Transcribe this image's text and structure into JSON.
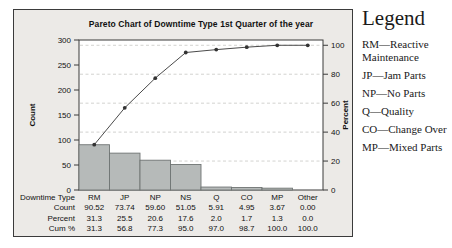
{
  "chart_data": {
    "type": "bar",
    "subtype": "pareto",
    "title": "Pareto Chart of Downtime Type 1st Quarter of the year",
    "categories": [
      "RM",
      "JP",
      "NP",
      "NS",
      "Q",
      "CO",
      "MP",
      "Other"
    ],
    "series": [
      {
        "name": "Count",
        "type": "bar",
        "axis": "left",
        "values": [
          90.52,
          73.74,
          59.6,
          51.05,
          5.91,
          4.95,
          3.67,
          0.0
        ]
      },
      {
        "name": "Cum %",
        "type": "line",
        "axis": "right",
        "values": [
          31.3,
          56.8,
          77.3,
          95.0,
          97.0,
          98.7,
          100.0,
          100.0
        ]
      }
    ],
    "left_axis": {
      "label": "Count",
      "min": 0,
      "max": 300,
      "ticks": [
        0,
        50,
        100,
        150,
        200,
        250,
        300
      ]
    },
    "right_axis": {
      "label": "Percent",
      "min": 0,
      "max": 100,
      "ticks": [
        0,
        20,
        40,
        60,
        80,
        100
      ]
    },
    "grid": {
      "horizontal_dashed_at_right_axis_ticks": true
    },
    "legend_position": "right-outside"
  },
  "table": {
    "rows": [
      {
        "label": "Downtime Type",
        "values": [
          "RM",
          "JP",
          "NP",
          "NS",
          "Q",
          "CO",
          "MP",
          "Other"
        ]
      },
      {
        "label": "Count",
        "values": [
          "90.52",
          "73.74",
          "59.60",
          "51.05",
          "5.91",
          "4.95",
          "3.67",
          "0.00"
        ]
      },
      {
        "label": "Percent",
        "values": [
          "31.3",
          "25.5",
          "20.6",
          "17.6",
          "2.0",
          "1.7",
          "1.3",
          "0.0"
        ]
      },
      {
        "label": "Cum %",
        "values": [
          "31.3",
          "56.8",
          "77.3",
          "95.0",
          "97.0",
          "98.7",
          "100.0",
          "100.0"
        ]
      }
    ]
  },
  "legend": {
    "title": "Legend",
    "items": [
      "RM—Reactive Maintenance",
      "JP—Jam Parts",
      "NP—No Parts",
      "Q—Quality",
      "CO—Change Over",
      "MP—Mixed Parts"
    ]
  },
  "colors": {
    "bar_fill": "#b6bab9",
    "bar_stroke": "#6f7473",
    "line": "#4a4a4a",
    "marker": "#333333",
    "panel_bg": "#eceae7",
    "plot_bg": "#ffffff",
    "grid": "#c6c6c3",
    "frame": "#3b3b3b",
    "text": "#111111"
  }
}
